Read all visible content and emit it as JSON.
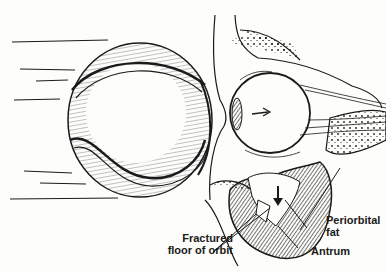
{
  "figure": {
    "labels": {
      "fractured_floor_line1": "Fractured",
      "fractured_floor_line2": "floor of orbit",
      "periorbital_line1": "Periorbital",
      "periorbital_line2": "fat",
      "antrum": "Antrum"
    },
    "colors": {
      "ink": "#1a1a1a",
      "paper": "#fdfdfb"
    }
  }
}
